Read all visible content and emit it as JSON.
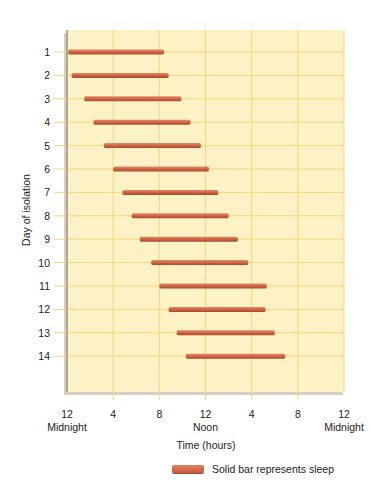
{
  "chart_data": {
    "type": "gantt-bar",
    "title": "",
    "xlabel": "Time (hours)",
    "ylabel": "Day of isolation",
    "x_ticks": [
      {
        "hour": 0,
        "label": "12",
        "sublabel": "Midnight"
      },
      {
        "hour": 4,
        "label": "4",
        "sublabel": ""
      },
      {
        "hour": 8,
        "label": "8",
        "sublabel": ""
      },
      {
        "hour": 12,
        "label": "12",
        "sublabel": "Noon"
      },
      {
        "hour": 16,
        "label": "4",
        "sublabel": ""
      },
      {
        "hour": 20,
        "label": "8",
        "sublabel": ""
      },
      {
        "hour": 24,
        "label": "12",
        "sublabel": "Midnight"
      }
    ],
    "xlim": [
      0,
      24
    ],
    "categories": [
      "1",
      "2",
      "3",
      "4",
      "5",
      "6",
      "7",
      "8",
      "9",
      "10",
      "11",
      "12",
      "13",
      "14"
    ],
    "series": [
      {
        "name": "Solid bar represents sleep",
        "color": "#c9603f",
        "start_hours": [
          0.1,
          0.4,
          1.5,
          2.3,
          3.2,
          4.0,
          4.8,
          5.6,
          6.3,
          7.3,
          8.0,
          8.8,
          9.5,
          10.3
        ],
        "end_hours": [
          8.4,
          8.8,
          9.9,
          10.7,
          11.6,
          12.3,
          13.1,
          14.0,
          14.8,
          15.7,
          17.3,
          17.2,
          18.0,
          18.9
        ]
      }
    ],
    "grid": true,
    "legend_position": "bottom-right"
  },
  "legend": {
    "label": "Solid bar represents sleep"
  },
  "colors": {
    "panel_bg": "#fdf1c6",
    "grid": "#f3d878",
    "bar": "#c9603f",
    "panel_shadow": "#b5ab92"
  }
}
